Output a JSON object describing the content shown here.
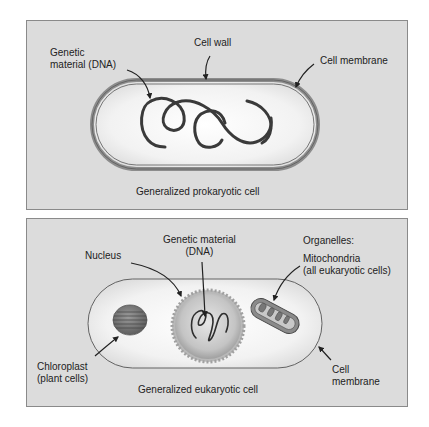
{
  "prokaryotic": {
    "labels": {
      "genetic_material_line1": "Genetic",
      "genetic_material_line2": "material (DNA)",
      "cell_wall": "Cell wall",
      "cell_membrane": "Cell membrane",
      "caption": "Generalized prokaryotic cell"
    }
  },
  "eukaryotic": {
    "labels": {
      "nucleus": "Nucleus",
      "genetic_material_line1": "Genetic material",
      "genetic_material_line2": "(DNA)",
      "organelles": "Organelles:",
      "mitochondria_line1": "Mitochondria",
      "mitochondria_line2": "(all eukaryotic cells)",
      "chloroplast_line1": "Chloroplast",
      "chloroplast_line2": "(plant cells)",
      "cell_membrane_line1": "Cell",
      "cell_membrane_line2": "membrane",
      "caption": "Generalized eukaryotic cell"
    }
  },
  "colors": {
    "panel_bg": "#dcdcdc",
    "panel_border": "#8a8a8a",
    "cell_wall": "#8c8c8c",
    "dna": "#3a3a3a",
    "nucleus": "#a8a8a8",
    "chloroplast": "#6e6e6e",
    "mitochondrion": "#7a7a7a"
  }
}
